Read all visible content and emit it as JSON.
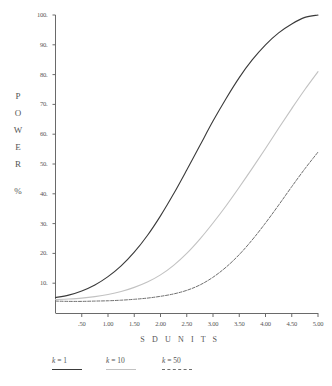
{
  "chart_data": {
    "type": "line",
    "title": "",
    "xlabel": "S D   U N I T S",
    "ylabel_chars": [
      "P",
      "O",
      "W",
      "E",
      "R"
    ],
    "ylabel_unit": "%",
    "xlim": [
      0,
      5
    ],
    "ylim": [
      0,
      100
    ],
    "grid": false,
    "legend_position": "bottom",
    "xticklabels": [
      ".50",
      "1.00",
      "1.50",
      "2.00",
      "2.50",
      "3.00",
      "3.50",
      "4.00",
      "4.50",
      "5.00"
    ],
    "xtickvalues": [
      0.5,
      1.0,
      1.5,
      2.0,
      2.5,
      3.0,
      3.5,
      4.0,
      4.5,
      5.0
    ],
    "yticklabels": [
      "10.",
      "20.",
      "30.",
      "40.",
      "50.",
      "60.",
      "70.",
      "80.",
      "90.",
      "100."
    ],
    "ytickvalues": [
      10,
      20,
      30,
      40,
      50,
      60,
      70,
      80,
      90,
      100
    ],
    "x": [
      0.0,
      0.25,
      0.5,
      0.75,
      1.0,
      1.25,
      1.5,
      1.75,
      2.0,
      2.25,
      2.5,
      2.75,
      3.0,
      3.25,
      3.5,
      3.75,
      4.0,
      4.25,
      4.5,
      4.75,
      5.0
    ],
    "series": [
      {
        "name": "k = 1",
        "k": 1,
        "color": "#3a3a3a",
        "style": "solid",
        "values": [
          5.2,
          6.0,
          7.4,
          9.4,
          12.2,
          15.8,
          20.4,
          26.0,
          32.6,
          40.0,
          48.0,
          56.2,
          64.4,
          72.0,
          79.0,
          85.0,
          90.0,
          94.0,
          97.0,
          99.2,
          100.0
        ]
      },
      {
        "name": "k = 10",
        "k": 10,
        "color": "#c2c2c2",
        "style": "solid",
        "values": [
          4.5,
          4.7,
          5.0,
          5.5,
          6.2,
          7.2,
          8.6,
          10.4,
          12.8,
          16.0,
          20.0,
          24.8,
          30.2,
          36.0,
          42.2,
          48.6,
          55.2,
          62.0,
          68.6,
          75.0,
          81.0
        ]
      },
      {
        "name": "k = 50",
        "k": 50,
        "color": "#6f6f6f",
        "style": "dashed",
        "values": [
          4.0,
          3.9,
          3.9,
          4.0,
          4.1,
          4.3,
          4.6,
          5.0,
          5.6,
          6.4,
          7.6,
          9.4,
          12.0,
          15.4,
          19.6,
          24.6,
          30.2,
          36.2,
          42.4,
          48.4,
          54.0
        ]
      }
    ]
  },
  "legend": {
    "items": [
      {
        "label_k": "k",
        "label_rest": " =  1",
        "full": "k =  1"
      },
      {
        "label_k": "k",
        "label_rest": " = 10",
        "full": "k = 10"
      },
      {
        "label_k": "k",
        "label_rest": " = 50",
        "full": "k = 50"
      }
    ]
  }
}
